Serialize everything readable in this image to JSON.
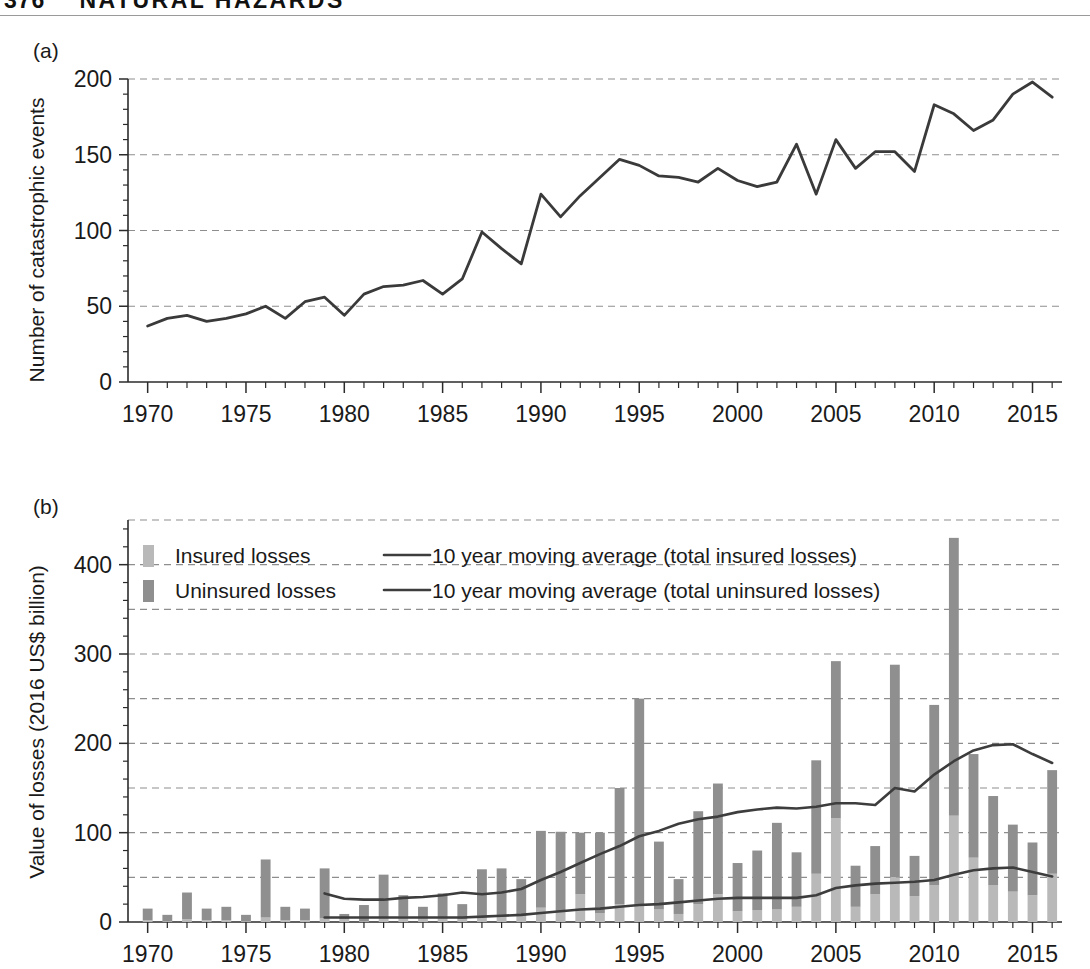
{
  "header": {
    "folio": "376",
    "running_head": "NATURAL HAZARDS"
  },
  "figure": {
    "panel_a_label": "(a)",
    "panel_b_label": "(b)"
  },
  "chart_data": [
    {
      "id": "panel-a",
      "type": "line",
      "title": "",
      "panel": "(a)",
      "xlabel": "",
      "ylabel": "Number of catastrophic events",
      "xlim": [
        1969,
        2016.5
      ],
      "ylim": [
        0,
        200
      ],
      "grid": true,
      "grid_values": [
        50,
        100,
        150,
        200
      ],
      "xticks": [
        1970,
        1975,
        1980,
        1985,
        1990,
        1995,
        2000,
        2005,
        2010,
        2015
      ],
      "xtick_labels": [
        "1970",
        "1975",
        "1980",
        "1985",
        "1990",
        "1995",
        "2000",
        "2005",
        "2010",
        "2015"
      ],
      "yticks": [
        0,
        50,
        100,
        150,
        200
      ],
      "ytick_labels": [
        "0",
        "50",
        "100",
        "150",
        "200"
      ],
      "x": [
        1970,
        1971,
        1972,
        1973,
        1974,
        1975,
        1976,
        1977,
        1978,
        1979,
        1980,
        1981,
        1982,
        1983,
        1984,
        1985,
        1986,
        1987,
        1988,
        1989,
        1990,
        1991,
        1992,
        1993,
        1994,
        1995,
        1996,
        1997,
        1998,
        1999,
        2000,
        2001,
        2002,
        2003,
        2004,
        2005,
        2006,
        2007,
        2008,
        2009,
        2010,
        2011,
        2012,
        2013,
        2014,
        2015,
        2016
      ],
      "values": [
        37,
        42,
        44,
        40,
        42,
        45,
        50,
        42,
        53,
        56,
        44,
        58,
        63,
        64,
        67,
        58,
        68,
        99,
        88,
        78,
        124,
        109,
        123,
        135,
        147,
        143,
        136,
        135,
        132,
        141,
        133,
        129,
        132,
        157,
        124,
        160,
        141,
        152,
        152,
        139,
        183,
        177,
        166,
        173,
        190,
        198,
        188
      ],
      "series_name": "Number of catastrophic events"
    },
    {
      "id": "panel-b",
      "type": "bar",
      "title": "",
      "panel": "(b)",
      "stacked": true,
      "xlabel": "",
      "ylabel": "Value of losses (2016 US$ billion)",
      "xlim": [
        1969,
        2016.5
      ],
      "ylim": [
        0,
        450
      ],
      "grid": true,
      "grid_values": [
        50,
        100,
        150,
        200,
        250,
        300,
        350,
        400,
        450
      ],
      "xticks": [
        1970,
        1975,
        1980,
        1985,
        1990,
        1995,
        2000,
        2005,
        2010,
        2015
      ],
      "xtick_labels": [
        "1970",
        "1975",
        "1980",
        "1985",
        "1990",
        "1995",
        "2000",
        "2005",
        "2010",
        "2015"
      ],
      "yticks": [
        0,
        100,
        200,
        300,
        400
      ],
      "ytick_labels": [
        "0",
        "100",
        "200",
        "300",
        "400"
      ],
      "categories": [
        1970,
        1971,
        1972,
        1973,
        1974,
        1975,
        1976,
        1977,
        1978,
        1979,
        1980,
        1981,
        1982,
        1983,
        1984,
        1985,
        1986,
        1987,
        1988,
        1989,
        1990,
        1991,
        1992,
        1993,
        1994,
        1995,
        1996,
        1997,
        1998,
        1999,
        2000,
        2001,
        2002,
        2003,
        2004,
        2005,
        2006,
        2007,
        2008,
        2009,
        2010,
        2011,
        2012,
        2013,
        2014,
        2015,
        2016
      ],
      "series": [
        {
          "name": "Insured losses",
          "color": "#b9b9b9",
          "values": [
            2,
            1,
            3,
            2,
            2,
            1,
            5,
            2,
            2,
            4,
            3,
            1,
            5,
            6,
            5,
            5,
            3,
            7,
            6,
            7,
            16,
            12,
            31,
            10,
            20,
            18,
            14,
            9,
            20,
            31,
            12,
            13,
            14,
            17,
            54,
            116,
            17,
            31,
            50,
            29,
            41,
            119,
            72,
            41,
            34,
            30,
            54
          ]
        },
        {
          "name": "Uninsured losses",
          "color": "#8f8f8f",
          "values": [
            13,
            7,
            30,
            13,
            15,
            7,
            65,
            15,
            13,
            56,
            6,
            18,
            48,
            24,
            12,
            27,
            17,
            52,
            54,
            41,
            86,
            89,
            69,
            90,
            130,
            232,
            76,
            39,
            104,
            124,
            54,
            67,
            97,
            61,
            127,
            176,
            46,
            54,
            238,
            45,
            202,
            311,
            116,
            100,
            75,
            59,
            116
          ]
        }
      ],
      "lines": [
        {
          "name": "10 year moving average (total insured losses)",
          "color": "#3d3d3d",
          "x": [
            1979,
            1980,
            1981,
            1982,
            1983,
            1984,
            1985,
            1986,
            1987,
            1988,
            1989,
            1990,
            1991,
            1992,
            1993,
            1994,
            1995,
            1996,
            1997,
            1998,
            1999,
            2000,
            2001,
            2002,
            2003,
            2004,
            2005,
            2006,
            2007,
            2008,
            2009,
            2010,
            2011,
            2012,
            2013,
            2014,
            2015,
            2016
          ],
          "values": [
            5,
            5,
            5,
            5,
            5,
            5,
            5,
            5,
            6,
            7,
            8,
            10,
            12,
            14,
            15,
            17,
            19,
            20,
            22,
            24,
            26,
            27,
            27,
            27,
            27,
            30,
            38,
            41,
            43,
            44,
            45,
            47,
            53,
            58,
            60,
            61,
            56,
            51
          ]
        },
        {
          "name": "10 year moving average (total uninsured losses)",
          "color": "#3d3d3d",
          "x": [
            1979,
            1980,
            1981,
            1982,
            1983,
            1984,
            1985,
            1986,
            1987,
            1988,
            1989,
            1990,
            1991,
            1992,
            1993,
            1994,
            1995,
            1996,
            1997,
            1998,
            1999,
            2000,
            2001,
            2002,
            2003,
            2004,
            2005,
            2006,
            2007,
            2008,
            2009,
            2010,
            2011,
            2012,
            2013,
            2014,
            2015,
            2016
          ],
          "values": [
            32,
            26,
            25,
            25,
            27,
            28,
            30,
            33,
            31,
            33,
            37,
            47,
            56,
            66,
            76,
            85,
            96,
            102,
            110,
            115,
            118,
            123,
            126,
            128,
            127,
            129,
            133,
            133,
            131,
            150,
            146,
            165,
            180,
            192,
            198,
            199,
            188,
            178
          ]
        }
      ],
      "legend": {
        "position": "top-left",
        "entries": [
          {
            "label": "Insured losses",
            "type": "swatch",
            "color": "#b9b9b9"
          },
          {
            "label": "Uninsured losses",
            "type": "swatch",
            "color": "#8f8f8f"
          },
          {
            "label": "10 year moving average (total insured losses)",
            "type": "line",
            "color": "#3d3d3d"
          },
          {
            "label": "10 year moving average (total uninsured losses)",
            "type": "line",
            "color": "#3d3d3d"
          }
        ]
      }
    }
  ]
}
